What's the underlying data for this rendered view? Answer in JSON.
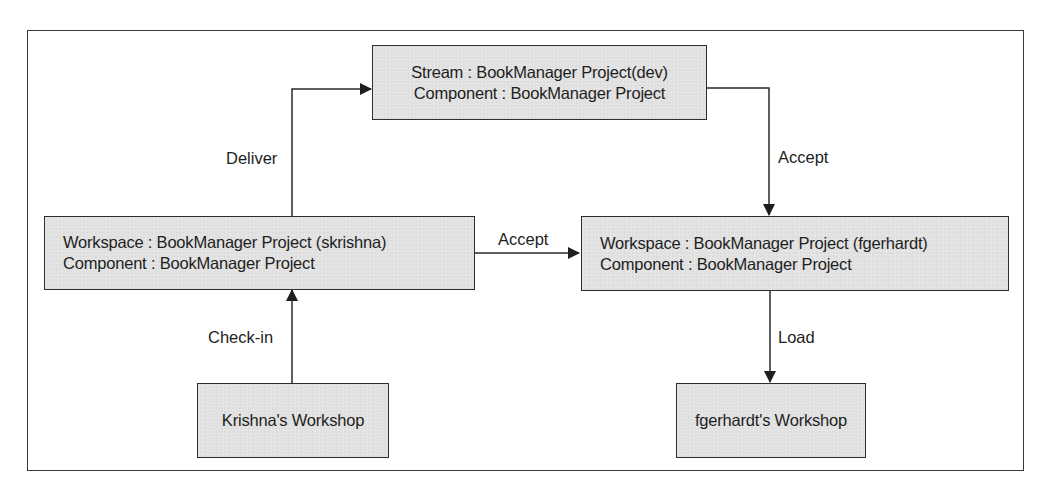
{
  "diagram": {
    "type": "flow",
    "nodes": {
      "stream": {
        "line1": "Stream : BookManager Project(dev)",
        "line2": "Component : BookManager Project"
      },
      "workspace_skrishna": {
        "line1": "Workspace : BookManager Project (skrishna)",
        "line2": "Component : BookManager Project"
      },
      "workspace_fgerhardt": {
        "line1": "Workspace : BookManager Project (fgerhardt)",
        "line2": "Component : BookManager Project"
      },
      "krishna_workshop": {
        "label": "Krishna's Workshop"
      },
      "fgerhardt_workshop": {
        "label": "fgerhardt's Workshop"
      }
    },
    "edges": [
      {
        "from": "workspace_skrishna",
        "to": "stream",
        "label": "Deliver"
      },
      {
        "from": "stream",
        "to": "workspace_fgerhardt",
        "label": "Accept"
      },
      {
        "from": "workspace_skrishna",
        "to": "workspace_fgerhardt",
        "label": "Accept"
      },
      {
        "from": "krishna_workshop",
        "to": "workspace_skrishna",
        "label": "Check-in"
      },
      {
        "from": "workspace_fgerhardt",
        "to": "fgerhardt_workshop",
        "label": "Load"
      }
    ],
    "colors": {
      "node_fill": "#e2e2e2",
      "stroke": "#2e2e2e",
      "text": "#1e1e1e",
      "background": "#ffffff"
    }
  }
}
